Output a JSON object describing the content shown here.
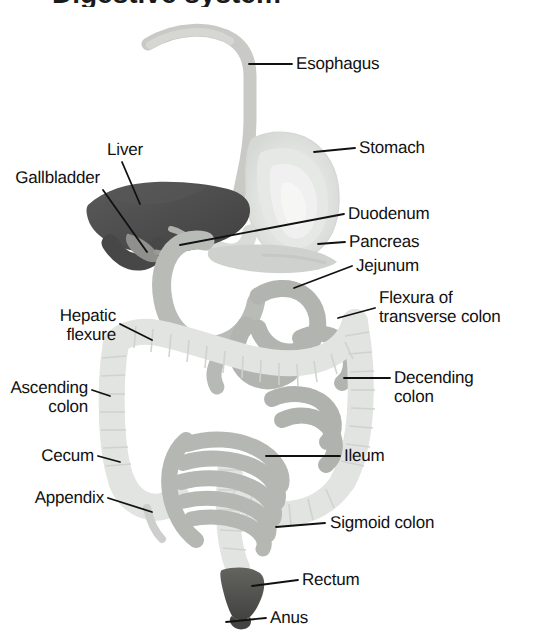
{
  "figure": {
    "title_partial": "Digestive system",
    "title_visible_note": "cropped at top edge",
    "background_color": "#ffffff",
    "label_color": "#111111",
    "leader_line_color": "#111111"
  },
  "palette": {
    "esophagus": "#c9cac6",
    "stomach": "#dcdedb",
    "stomach_inner": "#eceeeb",
    "liver": "#4e4e4e",
    "gallbladder": "#8d8d8a",
    "duodenum": "#b9bbb7",
    "pancreas": "#cfd1ce",
    "jejunum": "#b2b4b0",
    "ileum": "#b5b7b3",
    "colon": "#e2e4e1",
    "colon_outline": "#d2d4d1",
    "rectum": "#5a5a58",
    "anus": "#4a4a48"
  },
  "labels": [
    {
      "id": "esophagus",
      "text": "Esophagus",
      "align": "left"
    },
    {
      "id": "stomach",
      "text": "Stomach",
      "align": "left"
    },
    {
      "id": "liver",
      "text": "Liver",
      "align": "center"
    },
    {
      "id": "gallbladder",
      "text": "Gallbladder",
      "align": "right"
    },
    {
      "id": "duodenum",
      "text": "Duodenum",
      "align": "left"
    },
    {
      "id": "pancreas",
      "text": "Pancreas",
      "align": "left"
    },
    {
      "id": "jejunum",
      "text": "Jejunum",
      "align": "left"
    },
    {
      "id": "flexura",
      "text": "Flexura of\ntransverse colon",
      "align": "left"
    },
    {
      "id": "hepatic",
      "text": "Hepatic\nflexure",
      "align": "right"
    },
    {
      "id": "ascending",
      "text": "Ascending\ncolon",
      "align": "right"
    },
    {
      "id": "descending",
      "text": "Decending\ncolon",
      "align": "left"
    },
    {
      "id": "cecum",
      "text": "Cecum",
      "align": "right"
    },
    {
      "id": "ileum",
      "text": "Ileum",
      "align": "left"
    },
    {
      "id": "appendix",
      "text": "Appendix",
      "align": "right"
    },
    {
      "id": "sigmoid",
      "text": "Sigmoid colon",
      "align": "left"
    },
    {
      "id": "rectum",
      "text": "Rectum",
      "align": "left"
    },
    {
      "id": "anus",
      "text": "Anus",
      "align": "left"
    }
  ],
  "organs": [
    {
      "id": "esophagus",
      "name": "Esophagus"
    },
    {
      "id": "stomach",
      "name": "Stomach"
    },
    {
      "id": "liver",
      "name": "Liver"
    },
    {
      "id": "gallbladder",
      "name": "Gallbladder"
    },
    {
      "id": "duodenum",
      "name": "Duodenum"
    },
    {
      "id": "pancreas",
      "name": "Pancreas"
    },
    {
      "id": "jejunum",
      "name": "Jejunum"
    },
    {
      "id": "ileum",
      "name": "Ileum"
    },
    {
      "id": "colon",
      "name": "Large intestine"
    },
    {
      "id": "appendix",
      "name": "Appendix"
    },
    {
      "id": "rectum",
      "name": "Rectum"
    },
    {
      "id": "anus",
      "name": "Anus"
    }
  ]
}
